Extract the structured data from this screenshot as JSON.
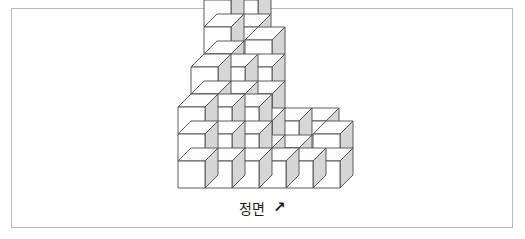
{
  "figure": {
    "frame": {
      "border_color": "#b9b9b9",
      "background": "#ffffff"
    },
    "label": {
      "text": "정면",
      "arrow": "↗",
      "arrow_name": "arrow-up-right-icon",
      "meaning_note": "정면"
    },
    "cube_style": {
      "front_face_color": "#ffffff",
      "top_face_color": "#fdfdfd",
      "side_face_color": "#d6d6d6",
      "edge_color": "#4a4a4a"
    }
  },
  "chart_data": {
    "type": "diagram",
    "title": "정면",
    "projection": {
      "cube_width": 27,
      "cube_height": 27,
      "depth_dx": 13,
      "depth_dy": -13,
      "origin_x": 178,
      "origin_y": 188
    },
    "columns": [
      {
        "col": 0,
        "row": 0,
        "height": 3
      },
      {
        "col": 1,
        "row": 0,
        "height": 3
      },
      {
        "col": 2,
        "row": 0,
        "height": 3
      },
      {
        "col": 0,
        "row": 1,
        "height": 4
      },
      {
        "col": 1,
        "row": 1,
        "height": 4
      },
      {
        "col": 2,
        "row": 1,
        "height": 5
      },
      {
        "col": 0,
        "row": 2,
        "height": 6
      },
      {
        "col": 1,
        "row": 2,
        "height": 6
      },
      {
        "col": 3,
        "row": 0,
        "height": 1
      },
      {
        "col": 4,
        "row": 0,
        "height": 1
      },
      {
        "col": 5,
        "row": 0,
        "height": 2
      },
      {
        "col": 3,
        "row": 1,
        "height": 2
      },
      {
        "col": 4,
        "row": 1,
        "height": 2
      }
    ],
    "total_cubes": 42,
    "xlabel": "",
    "ylabel": ""
  }
}
